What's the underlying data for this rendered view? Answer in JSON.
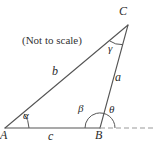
{
  "figure": {
    "note": "(Not to scale)",
    "type": "triangle-with-exterior-angle",
    "stroke_color": "#555555",
    "dash_color": "#9a9a9a",
    "text_color": "#2b2b2b",
    "background_color": "#ffffff",
    "width": 158,
    "height": 145
  },
  "vertices": [
    {
      "name": "A",
      "label": "A",
      "x": 5,
      "y": 128
    },
    {
      "name": "B",
      "label": "B",
      "x": 100,
      "y": 128
    },
    {
      "name": "C",
      "label": "C",
      "x": 128,
      "y": 25
    }
  ],
  "sides": [
    {
      "name": "a",
      "label": "a",
      "from": "B",
      "to": "C"
    },
    {
      "name": "b",
      "label": "b",
      "from": "A",
      "to": "C"
    },
    {
      "name": "c",
      "label": "c",
      "from": "A",
      "to": "B"
    }
  ],
  "angles": [
    {
      "name": "alpha",
      "label": "α",
      "at": "A",
      "kind": "interior"
    },
    {
      "name": "beta",
      "label": "β",
      "at": "B",
      "kind": "interior"
    },
    {
      "name": "gamma",
      "label": "γ",
      "at": "C",
      "kind": "interior"
    },
    {
      "name": "theta",
      "label": "θ",
      "at": "B",
      "kind": "exterior"
    }
  ],
  "dashed_ray": {
    "name": "extension-of-AB",
    "from_x": 100,
    "from_y": 128,
    "to_x": 156,
    "to_y": 128
  }
}
